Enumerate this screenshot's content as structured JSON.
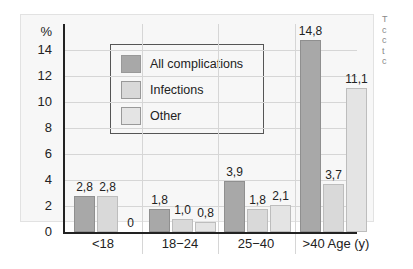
{
  "chart_data": {
    "type": "bar",
    "title": "",
    "xlabel": "Age (y)",
    "ylabel": "%",
    "ylim": [
      0,
      15
    ],
    "yticks": [
      0,
      2,
      4,
      6,
      8,
      10,
      12,
      14
    ],
    "grid": true,
    "legend_position": "upper-left inside",
    "categories": [
      "<18",
      "18-24",
      "25-40",
      ">40"
    ],
    "series": [
      {
        "name": "All complications",
        "color": "#a8a8a8",
        "values": [
          2.8,
          1.8,
          3.9,
          14.8
        ],
        "labels": [
          "2,8",
          "1,8",
          "3,9",
          "14,8"
        ]
      },
      {
        "name": "Infections",
        "color": "#d9d9d9",
        "values": [
          2.8,
          1.0,
          1.8,
          3.7
        ],
        "labels": [
          "2,8",
          "1,0",
          "1,8",
          "3,7"
        ]
      },
      {
        "name": "Other",
        "color": "#e4e4e4",
        "values": [
          0,
          0.8,
          2.1,
          11.1
        ],
        "labels": [
          "0",
          "0,8",
          "2,1",
          "11,1"
        ]
      }
    ]
  },
  "axis": {
    "y_unit": "%",
    "y_ticks": [
      "0",
      "2",
      "4",
      "6",
      "8",
      "10",
      "12",
      "14"
    ],
    "x_categories": [
      "<18",
      "18−24",
      "25−40",
      ">40 Age (y)"
    ]
  },
  "legend": {
    "items": [
      {
        "label": "All complications",
        "color": "#a8a8a8"
      },
      {
        "label": "Infections",
        "color": "#d9d9d9"
      },
      {
        "label": "Other",
        "color": "#e4e4e4"
      }
    ]
  },
  "side_text": {
    "lines": [
      "T",
      "c",
      "c",
      "t",
      "c"
    ]
  }
}
